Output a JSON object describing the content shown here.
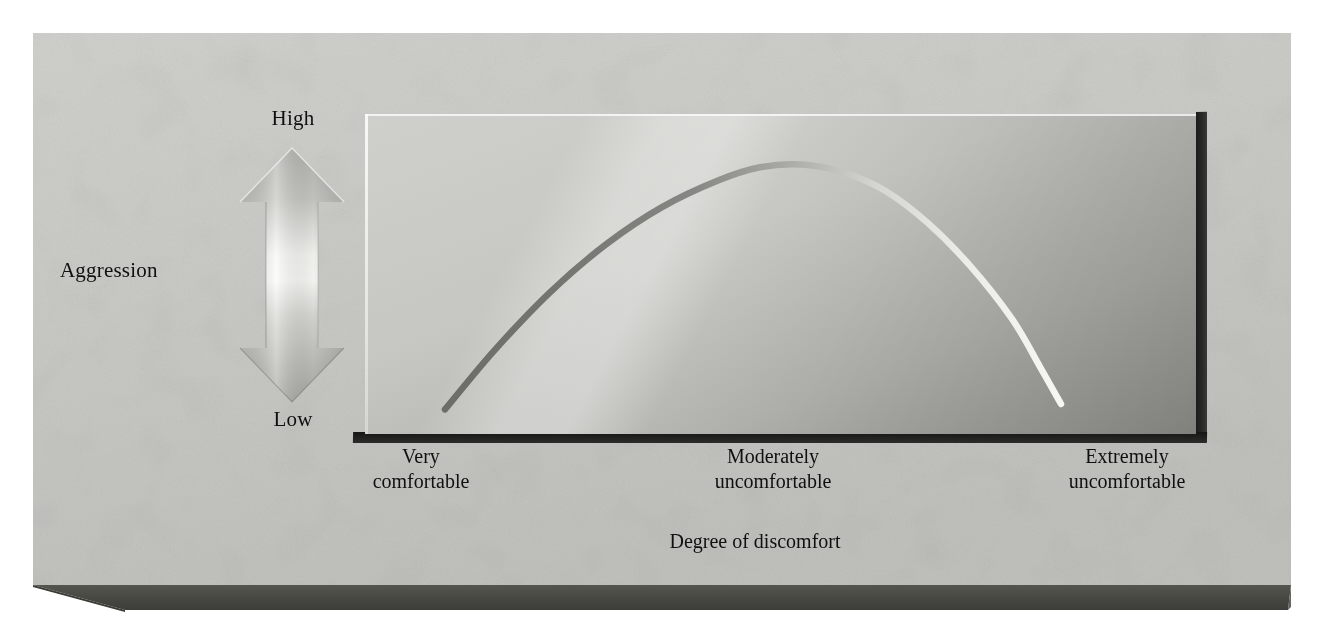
{
  "figure": {
    "kind": "conceptual-diagram",
    "medium": "printed textbook illustration on a grey 3-D concrete slab"
  },
  "axes": {
    "y_axis": {
      "title": "Aggression",
      "high_label": "High",
      "low_label": "Low",
      "indicator": "double-headed-vertical-arrow"
    },
    "x_axis": {
      "title": "Degree of discomfort",
      "tick_labels": [
        "Very\ncomfortable",
        "Moderately\nuncomfortable",
        "Extremely\nuncomfortable"
      ]
    }
  },
  "chart_data": {
    "type": "line",
    "title": "",
    "subtitle": "",
    "xlabel": "Degree of discomfort",
    "ylabel": "Aggression",
    "grid": false,
    "legend": null,
    "xlim": [
      0,
      100
    ],
    "ylim": [
      0,
      100
    ],
    "xtick_labels": [
      "Very comfortable",
      "Moderately uncomfortable",
      "Extremely uncomfortable"
    ],
    "xtick_positions": [
      5,
      50,
      95
    ],
    "ytick_labels": [
      "Low",
      "High"
    ],
    "ytick_positions": [
      0,
      100
    ],
    "series": [
      {
        "name": "Aggression",
        "shape": "inverted-U (curvilinear)",
        "x": [
          5,
          12,
          20,
          28,
          36,
          44,
          50,
          56,
          62,
          68,
          74,
          80,
          86,
          90,
          93
        ],
        "y": [
          4,
          26,
          48,
          66,
          80,
          90,
          95,
          96,
          93,
          86,
          74,
          58,
          38,
          20,
          6
        ]
      }
    ],
    "annotations": [
      {
        "text": "Aggression peaks at moderate discomfort then falls off",
        "visible": false
      }
    ]
  },
  "colors": {
    "slab_top": "#c9c9c5",
    "slab_edge": "#4a4a48",
    "panel_light": "#cfcfcb",
    "panel_dark": "#9a9a96",
    "curve_dark": "#6e6e6b",
    "curve_light": "#f2f2ee",
    "text": "#101010"
  },
  "icons": {
    "y_arrow": "double-arrow-vertical-icon"
  }
}
